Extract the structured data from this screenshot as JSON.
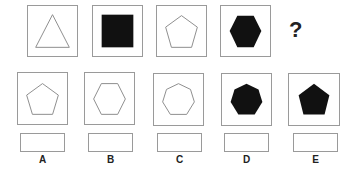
{
  "question": {
    "sequence": [
      {
        "shape": "triangle",
        "sides": 3,
        "fill": "none"
      },
      {
        "shape": "square",
        "sides": 4,
        "fill": "black"
      },
      {
        "shape": "pentagon",
        "sides": 5,
        "fill": "none"
      },
      {
        "shape": "hexagon",
        "sides": 6,
        "fill": "black"
      }
    ],
    "missing_mark": "?"
  },
  "options": [
    {
      "label": "A",
      "shape": "pentagon",
      "sides": 5,
      "fill": "none"
    },
    {
      "label": "B",
      "shape": "hexagon",
      "sides": 6,
      "fill": "none"
    },
    {
      "label": "C",
      "shape": "heptagon",
      "sides": 7,
      "fill": "none"
    },
    {
      "label": "D",
      "shape": "heptagon",
      "sides": 7,
      "fill": "black"
    },
    {
      "label": "E",
      "shape": "pentagon",
      "sides": 5,
      "fill": "black"
    }
  ],
  "colors": {
    "stroke": "#8a8a8a",
    "fill": "#111111",
    "border": "#9a9a9a"
  }
}
